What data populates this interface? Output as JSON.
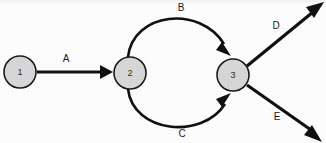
{
  "diagram": {
    "background_color": "#fdfdfd",
    "node_fill_color": "#d7d7d7",
    "node_stroke_color": "#1a1a1a",
    "edge_color": "#111111",
    "nodes": [
      {
        "id": "n1",
        "label": "1",
        "cx": 20,
        "cy": 72,
        "r": 16
      },
      {
        "id": "n2",
        "label": "2",
        "cx": 130,
        "cy": 73,
        "r": 16
      },
      {
        "id": "n3",
        "label": "3",
        "cx": 233,
        "cy": 75,
        "r": 16
      }
    ],
    "edges": [
      {
        "id": "e-a",
        "label": "A",
        "from": "n1",
        "to": "n2",
        "shape": "straight",
        "path": "M 37 72 L 105 72",
        "label_x": 66,
        "label_y": 58,
        "arrow_tip_x": 113,
        "arrow_tip_y": 72,
        "arrow_angle_deg": 0
      },
      {
        "id": "e-b",
        "label": "B",
        "from": "n2",
        "to": "n3",
        "shape": "curve-up",
        "path": "M 128 57 C 133 12, 200 5, 224 44",
        "label_x": 181,
        "label_y": 7,
        "arrow_tip_x": 230,
        "arrow_tip_y": 55,
        "arrow_angle_deg": 62
      },
      {
        "id": "e-c",
        "label": "C",
        "from": "n2",
        "to": "n3",
        "shape": "curve-down",
        "path": "M 128 89 C 133 133, 202 140, 225 104",
        "label_x": 182,
        "label_y": 133,
        "arrow_tip_x": 230,
        "arrow_tip_y": 94,
        "arrow_angle_deg": -60
      },
      {
        "id": "e-d",
        "label": "D",
        "from": "n3",
        "to": "out-d",
        "shape": "straight",
        "path": "M 247 66 L 313 12",
        "label_x": 276,
        "label_y": 25,
        "arrow_tip_x": 323,
        "arrow_tip_y": 4,
        "arrow_angle_deg": -39
      },
      {
        "id": "e-e",
        "label": "E",
        "from": "n3",
        "to": "out-e",
        "shape": "straight",
        "path": "M 247 85 L 311 130",
        "label_x": 277,
        "label_y": 116,
        "arrow_tip_x": 321,
        "arrow_tip_y": 141,
        "arrow_angle_deg": 35
      }
    ]
  }
}
